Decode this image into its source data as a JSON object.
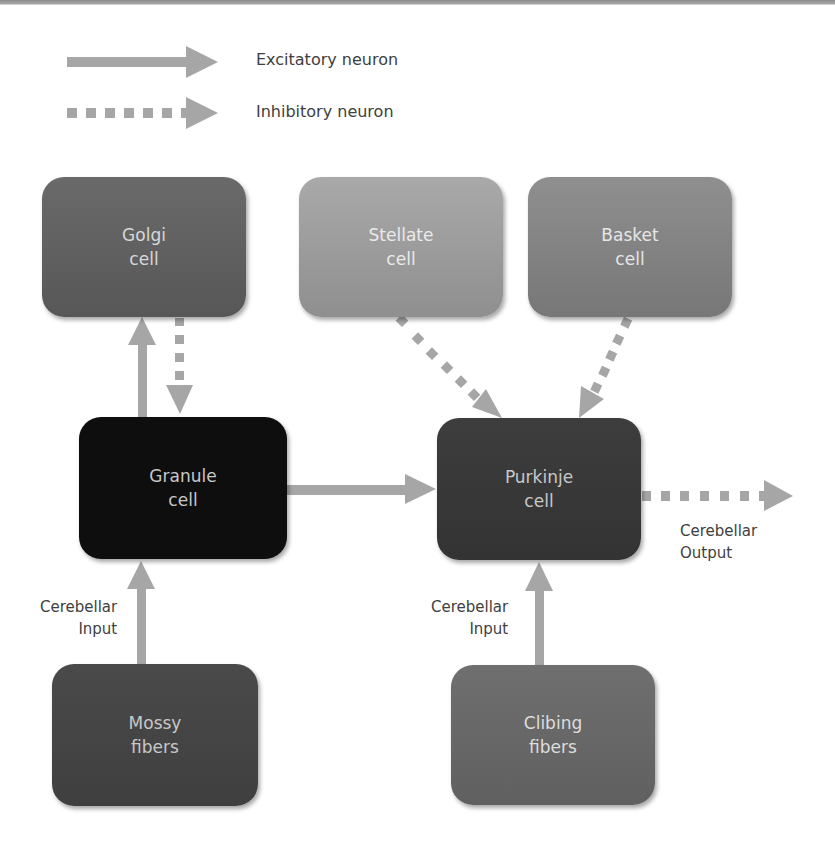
{
  "diagram": {
    "colors": {
      "arrow": "#a6a6a6",
      "background": "#ffffff",
      "label_text": "#404040"
    },
    "legend": [
      {
        "style": "solid",
        "label": "Excitatory neuron"
      },
      {
        "style": "dotted",
        "label": "Inhibitory neuron"
      }
    ],
    "nodes": {
      "golgi": {
        "line1": "Golgi",
        "line2": "cell"
      },
      "stellate": {
        "line1": "Stellate",
        "line2": "cell"
      },
      "basket": {
        "line1": "Basket",
        "line2": "cell"
      },
      "granule": {
        "line1": "Granule",
        "line2": "cell"
      },
      "purkinje": {
        "line1": "Purkinje",
        "line2": "cell"
      },
      "mossy": {
        "line1": "Mossy",
        "line2": "fibers"
      },
      "climbing": {
        "line1": "Clibing",
        "line2": "fibers"
      }
    },
    "annotations": {
      "input_left": {
        "line1": "Cerebellar",
        "line2": "Input"
      },
      "input_right": {
        "line1": "Cerebellar",
        "line2": "Input"
      },
      "output": {
        "line1": "Cerebellar",
        "line2": "Output"
      }
    },
    "edges": [
      {
        "from": "Granule cell",
        "to": "Golgi cell",
        "type": "excitatory"
      },
      {
        "from": "Golgi cell",
        "to": "Granule cell",
        "type": "inhibitory"
      },
      {
        "from": "Granule cell",
        "to": "Purkinje cell",
        "type": "excitatory"
      },
      {
        "from": "Stellate cell",
        "to": "Purkinje cell",
        "type": "inhibitory"
      },
      {
        "from": "Basket cell",
        "to": "Purkinje cell",
        "type": "inhibitory"
      },
      {
        "from": "Mossy fibers",
        "to": "Granule cell",
        "type": "excitatory"
      },
      {
        "from": "Clibing fibers",
        "to": "Purkinje cell",
        "type": "excitatory"
      },
      {
        "from": "Purkinje cell",
        "to": "Cerebellar Output",
        "type": "inhibitory"
      }
    ]
  }
}
